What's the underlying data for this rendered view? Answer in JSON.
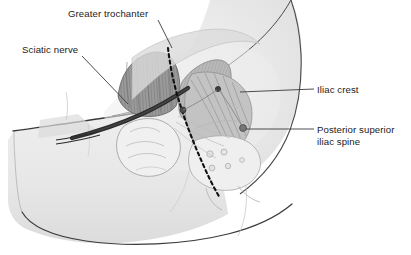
{
  "figure": {
    "background_color": "#ffffff",
    "skin_fill": "#e9e9e9",
    "outline_color": "#3a3a3a",
    "muscle_dark_color": "#8a8a8a",
    "muscle_mid_color": "#b4b4b4",
    "muscle_light_color": "#d2d2d2",
    "nerve_color": "#2b2b2b",
    "dashed_line_color": "#111111",
    "marker_color": "#6f6f6f",
    "leader_color": "#3a3a3a",
    "text_color": "#1b1b1b"
  },
  "labels": {
    "greater_trochanter": "Greater trochanter",
    "sciatic_nerve": "Sciatic nerve",
    "iliac_crest": "Iliac crest",
    "posterior_superior_iliac_spine_line1": "Posterior superior",
    "posterior_superior_iliac_spine_line2": "iliac spine"
  },
  "markers": {
    "greater_trochanter_point": "greater-trochanter-marker",
    "psis_point": "posterior-superior-iliac-spine-marker",
    "sciatic_notch_point": "sciatic-notch-marker"
  },
  "structures": {
    "gluteus_maximus": "gluteus-maximus-muscle",
    "gluteus_medius": "gluteus-medius-muscle",
    "piriformis": "piriformis-muscle",
    "sacrum": "sacrum",
    "femur_head": "femoral-head",
    "nerve_band": "sciatic-nerve-band",
    "incision_line": "dashed-incision-line",
    "body_outline": "patient-body-outline"
  }
}
